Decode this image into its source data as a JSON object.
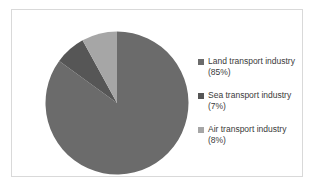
{
  "figure": {
    "background_color": "#ffffff",
    "border_color": "#d9d9d9"
  },
  "chart_data": {
    "type": "pie",
    "title": "",
    "subtitle": "",
    "xlabel": "",
    "ylabel": "",
    "grid": false,
    "legend_position": "right",
    "start_angle_deg": 0,
    "direction": "clockwise",
    "categories": [
      "Land transport industry",
      "Sea transport industry",
      "Air transport industry"
    ],
    "values": [
      85,
      7,
      8
    ],
    "value_labels": [
      "(85%)",
      "(7%)",
      "(8%)"
    ],
    "units": "percent",
    "colors": [
      "#6b6b6b",
      "#565656",
      "#a6a6a6"
    ],
    "slices": [
      {
        "label": "Land transport industry",
        "value": 85,
        "value_label": "(85%)",
        "color": "#6b6b6b",
        "start_deg": 0,
        "end_deg": 306
      },
      {
        "label": "Sea transport industry",
        "value": 7,
        "value_label": "(7%)",
        "color": "#565656",
        "start_deg": 306,
        "end_deg": 331.2
      },
      {
        "label": "Air transport industry",
        "value": 8,
        "value_label": "(8%)",
        "color": "#a6a6a6",
        "start_deg": 331.2,
        "end_deg": 360
      }
    ]
  },
  "legend": {
    "entries": [
      {
        "label": "Land transport industry",
        "value_label": "(85%)",
        "swatch_color": "#6b6b6b",
        "swatch_icon": "square-marker-icon"
      },
      {
        "label": "Sea transport industry",
        "value_label": "(7%)",
        "swatch_color": "#565656",
        "swatch_icon": "square-marker-icon"
      },
      {
        "label": "Air transport industry",
        "value_label": "(8%)",
        "swatch_color": "#a6a6a6",
        "swatch_icon": "square-marker-icon"
      }
    ]
  }
}
